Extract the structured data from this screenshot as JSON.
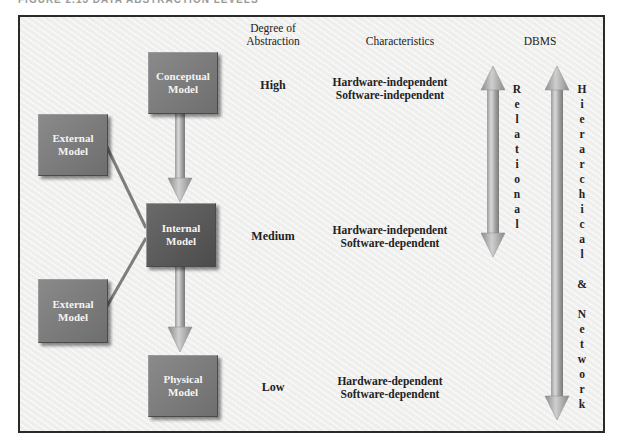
{
  "figure_title": "FIGURE 2.13  DATA ABSTRACTION LEVELS",
  "headers": {
    "abstraction": [
      "Degree of",
      "Abstraction"
    ],
    "characteristics": "Characteristics",
    "dbms": "DBMS"
  },
  "models": {
    "conceptual": [
      "Conceptual",
      "Model"
    ],
    "external_top": [
      "External",
      "Model"
    ],
    "internal": [
      "Internal",
      "Model"
    ],
    "external_bottom": [
      "External",
      "Model"
    ],
    "physical": [
      "Physical",
      "Model"
    ]
  },
  "levels": {
    "high": "High",
    "medium": "Medium",
    "low": "Low"
  },
  "characteristics": {
    "high": [
      "Hardware-independent",
      "Software-independent"
    ],
    "medium": [
      "Hardware-independent",
      "Software-dependent"
    ],
    "low": [
      "Hardware-dependent",
      "Software-dependent"
    ]
  },
  "dbms": {
    "relational": [
      "R",
      "e",
      "l",
      "a",
      "t",
      "i",
      "o",
      "n",
      "a",
      "l"
    ],
    "hierarchical_network": [
      "H",
      "i",
      "e",
      "r",
      "a",
      "r",
      "c",
      "h",
      "i",
      "c",
      "a",
      "l",
      "",
      "&",
      "",
      "N",
      "e",
      "t",
      "w",
      "o",
      "r",
      "k"
    ]
  },
  "colors": {
    "box_light": "#7a7a7a",
    "box_dark": "#5a5a5a",
    "arrow": "#a8a8a8",
    "connector": "#7d7d7d"
  }
}
